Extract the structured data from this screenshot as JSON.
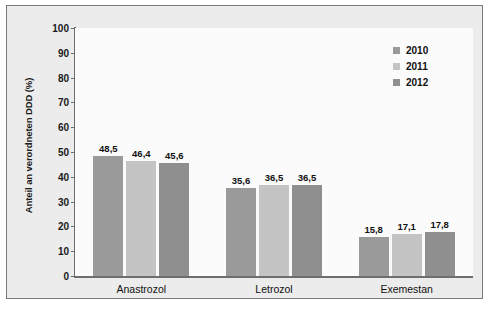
{
  "chart_data": {
    "type": "bar",
    "title": "",
    "subtitle": "",
    "xlabel": "",
    "ylabel": "Anteil an verordneten DDD (%)",
    "categories": [
      "Anastrozol",
      "Letrozol",
      "Exemestan"
    ],
    "series": [
      {
        "name": "2010",
        "color": "#9a9a9a",
        "values": [
          48.5,
          35.6,
          15.8
        ],
        "labels": [
          "48,5",
          "35,6",
          "15,8"
        ]
      },
      {
        "name": "2011",
        "color": "#c4c4c4",
        "values": [
          46.4,
          36.5,
          17.1
        ],
        "labels": [
          "46,4",
          "36,5",
          "17,1"
        ]
      },
      {
        "name": "2012",
        "color": "#8f8f8f",
        "values": [
          45.6,
          36.5,
          17.8
        ],
        "labels": [
          "45,6",
          "36,5",
          "17,8"
        ]
      }
    ],
    "ylim": [
      0,
      100
    ],
    "yticks": [
      "0",
      "10",
      "20",
      "30",
      "40",
      "50",
      "60",
      "70",
      "80",
      "90",
      "100"
    ],
    "grid": false,
    "legend_position": "top-right",
    "value_label_format": "comma-decimal"
  },
  "figure": {
    "frame_color": "#7a7a7a",
    "outer_background": "#ececec",
    "plot_background": "#fbfbfb",
    "axis_color": "#6d6d6d"
  }
}
